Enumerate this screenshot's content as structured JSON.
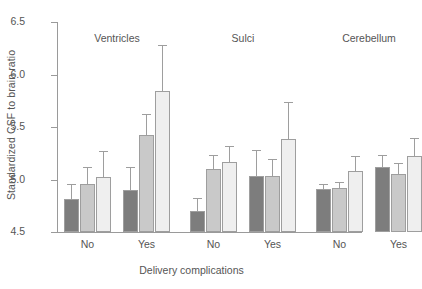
{
  "chart_data": {
    "type": "bar",
    "title": "",
    "xlabel": "Delivery complications",
    "ylabel": "Standardized CSF to brain ratio",
    "ylim": [
      4.5,
      6.5
    ],
    "yticks": [
      "4.5",
      "5.0",
      "5.5",
      "6.0",
      "6.5"
    ],
    "grid": false,
    "legend_position": "none",
    "group_labels": [
      "Ventricles",
      "Sulci",
      "Cerebellum"
    ],
    "categories": [
      "No",
      "Yes",
      "No",
      "Yes",
      "No",
      "Yes"
    ],
    "series": [
      {
        "name": "series-1-dark",
        "color": "#7d7d7d",
        "values": [
          4.81,
          4.9,
          4.7,
          5.03,
          4.91,
          5.12
        ],
        "err_upper": [
          4.96,
          5.12,
          4.82,
          5.28,
          4.96,
          5.23
        ]
      },
      {
        "name": "series-2-mid",
        "color": "#c9c9c9",
        "values": [
          4.96,
          5.42,
          5.1,
          5.03,
          4.92,
          5.05
        ],
        "err_upper": [
          5.12,
          5.62,
          5.23,
          5.2,
          4.98,
          5.16
        ]
      },
      {
        "name": "series-3-light",
        "color": "#efefef",
        "values": [
          5.02,
          5.84,
          5.17,
          5.39,
          5.08,
          5.22
        ],
        "err_upper": [
          5.27,
          6.28,
          5.32,
          5.74,
          5.22,
          5.4
        ]
      }
    ],
    "bars": [
      {
        "group": "Ventricles",
        "x": "No",
        "series": "series-1-dark",
        "value": 4.81,
        "err_upper": 4.96
      },
      {
        "group": "Ventricles",
        "x": "No",
        "series": "series-2-mid",
        "value": 4.96,
        "err_upper": 5.12
      },
      {
        "group": "Ventricles",
        "x": "No",
        "series": "series-3-light",
        "value": 5.02,
        "err_upper": 5.27
      },
      {
        "group": "Ventricles",
        "x": "Yes",
        "series": "series-1-dark",
        "value": 4.9,
        "err_upper": 5.12
      },
      {
        "group": "Ventricles",
        "x": "Yes",
        "series": "series-2-mid",
        "value": 5.42,
        "err_upper": 5.62
      },
      {
        "group": "Ventricles",
        "x": "Yes",
        "series": "series-3-light",
        "value": 5.84,
        "err_upper": 6.28
      },
      {
        "group": "Sulci",
        "x": "No",
        "series": "series-1-dark",
        "value": 4.7,
        "err_upper": 4.82
      },
      {
        "group": "Sulci",
        "x": "No",
        "series": "series-2-mid",
        "value": 5.1,
        "err_upper": 5.23
      },
      {
        "group": "Sulci",
        "x": "No",
        "series": "series-3-light",
        "value": 5.17,
        "err_upper": 5.32
      },
      {
        "group": "Sulci",
        "x": "Yes",
        "series": "series-1-dark",
        "value": 5.03,
        "err_upper": 5.28
      },
      {
        "group": "Sulci",
        "x": "Yes",
        "series": "series-2-mid",
        "value": 5.03,
        "err_upper": 5.2
      },
      {
        "group": "Sulci",
        "x": "Yes",
        "series": "series-3-light",
        "value": 5.39,
        "err_upper": 5.74
      },
      {
        "group": "Cerebellum",
        "x": "No",
        "series": "series-1-dark",
        "value": 4.91,
        "err_upper": 4.96
      },
      {
        "group": "Cerebellum",
        "x": "No",
        "series": "series-2-mid",
        "value": 4.92,
        "err_upper": 4.98
      },
      {
        "group": "Cerebellum",
        "x": "No",
        "series": "series-3-light",
        "value": 5.08,
        "err_upper": 5.22
      },
      {
        "group": "Cerebellum",
        "x": "Yes",
        "series": "series-1-dark",
        "value": 5.12,
        "err_upper": 5.23
      },
      {
        "group": "Cerebellum",
        "x": "Yes",
        "series": "series-2-mid",
        "value": 5.05,
        "err_upper": 5.16
      },
      {
        "group": "Cerebellum",
        "x": "Yes",
        "series": "series-3-light",
        "value": 5.22,
        "err_upper": 5.4
      }
    ]
  }
}
